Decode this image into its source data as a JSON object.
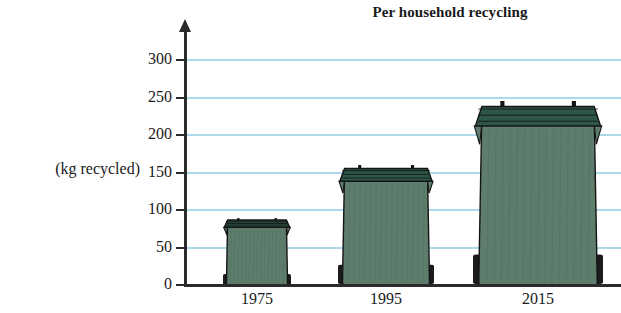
{
  "chart_data": {
    "type": "bar",
    "title": "Per household recycling",
    "xlabel": "",
    "ylabel": "(kg recycled)",
    "categories": [
      "1975",
      "1995",
      "2015"
    ],
    "values": [
      90,
      160,
      245
    ],
    "unit": "kg",
    "ylim": [
      0,
      300
    ],
    "ytick_values": [
      0,
      50,
      100,
      150,
      200,
      250,
      300
    ],
    "ytick_labels": [
      "0",
      "50",
      "100",
      "150",
      "200",
      "250",
      "300"
    ],
    "grid": true,
    "grid_axis": "y",
    "legend": false,
    "bar_style": "pictorial-wheelie-bin",
    "series": [
      {
        "name": "kg recycled",
        "values": [
          90,
          160,
          245
        ]
      }
    ],
    "annotations": [],
    "colors": {
      "bin_body": "#5e7d6c",
      "bin_lid": "#2e5748",
      "bin_outline": "#141414",
      "bin_wheel": "#1c1c1c",
      "gridline": "#a9d7ec",
      "axis": "#2b2b2b",
      "text": "#1a1a1a",
      "background": "#ffffff"
    }
  },
  "chart": {
    "title": "Per household recycling",
    "y_axis_label": "(kg recycled)",
    "y_ticks": [
      {
        "label": "300",
        "value": 300
      },
      {
        "label": "250",
        "value": 250
      },
      {
        "label": "200",
        "value": 200
      },
      {
        "label": "150",
        "value": 150
      },
      {
        "label": "100",
        "value": 100
      },
      {
        "label": "50",
        "value": 50
      },
      {
        "label": "0",
        "value": 0
      }
    ],
    "bars": [
      {
        "year": "1975",
        "value": 90
      },
      {
        "year": "1995",
        "value": 160
      },
      {
        "year": "2015",
        "value": 245
      }
    ]
  }
}
